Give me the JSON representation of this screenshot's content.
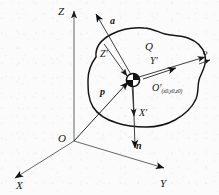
{
  "figure": {
    "kind": "technical-line-diagram",
    "background_color": "#fbfbfb",
    "ink_color": "#161616"
  },
  "global_axes": {
    "origin_label": "O",
    "z_label": "Z",
    "x_label": "X",
    "y_label": "Y"
  },
  "local_axes": {
    "origin_label": "O",
    "origin_prime_mark": "′",
    "origin_coords": "(x0,y0,z0)",
    "origin_coord_x": "x",
    "origin_coord_y": "y",
    "origin_coord_z": "z",
    "origin_coord_sub": "0",
    "x_label": "X′",
    "y_label": "Y′",
    "z_label": "Z′"
  },
  "vectors": {
    "a_label": "a",
    "n_label": "n",
    "p_label": "p"
  },
  "regions": {
    "surface_label": "Q",
    "boundary_point_label": "o"
  }
}
